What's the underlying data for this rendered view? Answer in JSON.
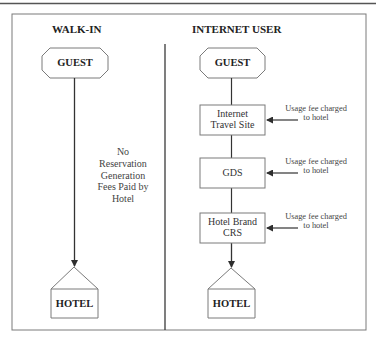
{
  "diagram": {
    "type": "flow-comparison",
    "columns": [
      {
        "heading": "WALK-IN",
        "start_node": "GUEST",
        "middle_note_lines": [
          "No",
          "Reservation",
          "Generation",
          "Fees Paid by",
          "Hotel"
        ],
        "end_node": "HOTEL"
      },
      {
        "heading": "INTERNET USER",
        "start_node": "GUEST",
        "steps": [
          {
            "label_lines": [
              "Internet",
              "Travel Site"
            ],
            "note_lines": [
              "Usage fee charged",
              "to hotel"
            ]
          },
          {
            "label_lines": [
              "GDS"
            ],
            "note_lines": [
              "Usage fee charged",
              "to hotel"
            ]
          },
          {
            "label_lines": [
              "Hotel Brand",
              "CRS"
            ],
            "note_lines": [
              "Usage fee charged",
              "to hotel"
            ]
          }
        ],
        "end_node": "HOTEL"
      }
    ],
    "edges": [
      {
        "from": "walkin.GUEST",
        "to": "walkin.HOTEL",
        "arrow": "end"
      },
      {
        "from": "internet.GUEST",
        "to": "Internet Travel Site",
        "arrow": "none"
      },
      {
        "from": "Internet Travel Site",
        "to": "GDS",
        "arrow": "none"
      },
      {
        "from": "GDS",
        "to": "Hotel Brand CRS",
        "arrow": "none"
      },
      {
        "from": "Hotel Brand CRS",
        "to": "internet.HOTEL",
        "arrow": "end"
      },
      {
        "from": "note.0",
        "to": "Internet Travel Site",
        "arrow": "end"
      },
      {
        "from": "note.1",
        "to": "GDS",
        "arrow": "end"
      },
      {
        "from": "note.2",
        "to": "Hotel Brand CRS",
        "arrow": "end"
      }
    ],
    "colors": {
      "line": "#3a3a3a",
      "frame": "#6e6e6e",
      "shape_stroke": "#7a7a7a",
      "text": "#2b2b2b",
      "background": "#ffffff"
    }
  }
}
